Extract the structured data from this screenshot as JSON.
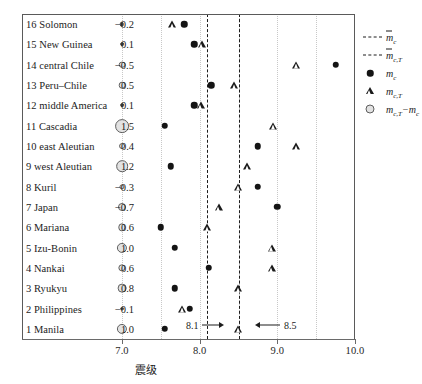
{
  "chart_data": {
    "type": "scatter",
    "title": "",
    "xlabel": "震级",
    "ylabel": "",
    "xlim": [
      7.0,
      10.0
    ],
    "xticks": [
      7.0,
      8.0,
      9.0,
      10.0
    ],
    "xtick_labels": [
      "7.0",
      "8.0",
      "9.0",
      "10.0"
    ],
    "gridlines": [
      7.0,
      7.5,
      8.0,
      8.5,
      9.0,
      9.5
    ],
    "grid": true,
    "legend_position": "right",
    "reference_lines": [
      {
        "name": "m-bar-c",
        "value": 8.1,
        "style": "dashed"
      },
      {
        "name": "m-bar-c-T",
        "value": 8.5,
        "style": "dashed"
      }
    ],
    "annotations": [
      {
        "text": "8.1",
        "value": 8.1,
        "arrow": "right"
      },
      {
        "text": "8.5",
        "value": 8.5,
        "arrow": "left"
      }
    ],
    "categories": [
      "1 Manila",
      "2 Philippines",
      "3 Ryukyu",
      "4 Nankai",
      "5 Izu-Bonin",
      "6 Mariana",
      "7 Japan",
      "8 Kuril",
      "9 west Aleutian",
      "10 east Aleutian",
      "11 Cascadia",
      "12 middle America",
      "13 Peru-Chile",
      "14 central Chile",
      "15 New Guinea",
      "16 Solomon"
    ],
    "series": [
      {
        "name": "m_c",
        "symbol": "filled-circle",
        "values": [
          7.55,
          7.87,
          7.68,
          8.12,
          7.68,
          7.5,
          9.0,
          8.75,
          7.63,
          8.75,
          7.55,
          7.93,
          8.15,
          9.75,
          7.93,
          7.8
        ]
      },
      {
        "name": "m_c,T",
        "symbol": "open-triangle",
        "values": [
          8.5,
          7.78,
          8.5,
          8.93,
          8.93,
          8.1,
          8.25,
          8.5,
          8.62,
          9.25,
          8.95,
          8.02,
          8.45,
          9.25,
          8.03,
          7.65
        ]
      },
      {
        "name": "m_c,T - m_c",
        "symbol": "open-bubble",
        "values": [
          1.0,
          -0.1,
          0.8,
          0.6,
          1.0,
          0.6,
          -0.7,
          -0.3,
          1.2,
          0.4,
          1.5,
          0.1,
          0.5,
          -0.5,
          0.1,
          -0.2
        ],
        "value_labels": [
          "1.0",
          "-0.1",
          "0.8",
          "0.6",
          "1.0",
          "0.6",
          "-0.7",
          "-0.3",
          "1.2",
          "0.4",
          "1.5",
          "0.1",
          "0.5",
          "-0.5",
          "0.1",
          "-0.2"
        ]
      }
    ]
  },
  "rows": [
    {
      "label": "16 Solomon",
      "value": "−0.2",
      "mc": 7.8,
      "mct": 7.65,
      "diff": -0.2
    },
    {
      "label": "15 New Guinea",
      "value": "0.1",
      "mc": 7.93,
      "mct": 8.03,
      "diff": 0.1
    },
    {
      "label": "14 central Chile",
      "value": "−0.5",
      "mc": 9.75,
      "mct": 9.25,
      "diff": -0.5
    },
    {
      "label": "13 Peru–Chile",
      "value": "0.5",
      "mc": 8.15,
      "mct": 8.45,
      "diff": 0.5
    },
    {
      "label": "12 middle America",
      "value": "0.1",
      "mc": 7.93,
      "mct": 8.02,
      "diff": 0.1
    },
    {
      "label": "11 Cascadia",
      "value": "1.5",
      "mc": 7.55,
      "mct": 8.95,
      "diff": 1.5
    },
    {
      "label": "10 east Aleutian",
      "value": "0.4",
      "mc": 8.75,
      "mct": 9.25,
      "diff": 0.4
    },
    {
      "label": "9 west Aleutian",
      "value": "1.2",
      "mc": 7.63,
      "mct": 8.62,
      "diff": 1.2
    },
    {
      "label": "8 Kuril",
      "value": "−0.3",
      "mc": 8.75,
      "mct": 8.5,
      "diff": -0.3
    },
    {
      "label": "7 Japan",
      "value": "−0.7",
      "mc": 9.0,
      "mct": 8.25,
      "diff": -0.7
    },
    {
      "label": "6 Mariana",
      "value": "0.6",
      "mc": 7.5,
      "mct": 8.1,
      "diff": 0.6
    },
    {
      "label": "5 Izu-Bonin",
      "value": "1.0",
      "mc": 7.68,
      "mct": 8.93,
      "diff": 1.0
    },
    {
      "label": "4 Nankai",
      "value": "0.6",
      "mc": 8.12,
      "mct": 8.93,
      "diff": 0.6
    },
    {
      "label": "3 Ryukyu",
      "value": "0.8",
      "mc": 7.68,
      "mct": 8.5,
      "diff": 0.8
    },
    {
      "label": "2 Philippines",
      "value": "−0.1",
      "mc": 7.87,
      "mct": 7.78,
      "diff": -0.1
    },
    {
      "label": "1 Manila",
      "value": "1.0",
      "mc": 7.55,
      "mct": 8.5,
      "diff": 1.0
    }
  ],
  "axis": {
    "title": "震级",
    "ticks": [
      "7.0",
      "8.0",
      "9.0",
      "10.0"
    ]
  },
  "annotations": {
    "left_marker": "8.1",
    "right_marker": "8.5"
  },
  "legend": [
    {
      "symbol": "dashed-line",
      "main": "m",
      "overline": true,
      "sub": "c"
    },
    {
      "symbol": "dashed-line-2",
      "main": "m",
      "overline": true,
      "sub": "c,T"
    },
    {
      "symbol": "filled-circle",
      "main": "m",
      "overline": false,
      "sub": "c"
    },
    {
      "symbol": "open-triangle",
      "main": "m",
      "overline": false,
      "sub": "c,T"
    },
    {
      "symbol": "open-bubble",
      "main": "m",
      "overline": false,
      "sub": "c,T",
      "suffix": "−m",
      "suffix_sub": "c"
    }
  ]
}
